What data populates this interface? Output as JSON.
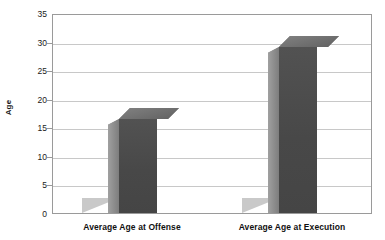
{
  "chart_data": {
    "type": "bar",
    "title": "",
    "subtitle": "",
    "xlabel": "",
    "ylabel": "Age",
    "categories": [
      "Average Age at Offense",
      "Average Age at Execution"
    ],
    "values": [
      16.5,
      29
    ],
    "series": [
      {
        "name": "Age",
        "values": [
          16.5,
          29
        ]
      }
    ],
    "ylim": [
      0,
      35
    ],
    "ytick_step": 5,
    "yticks": [
      "35",
      "30",
      "25",
      "20",
      "15",
      "10",
      "5",
      "0"
    ],
    "ytick_values": [
      35,
      30,
      25,
      20,
      15,
      10,
      5,
      0
    ],
    "grid": true,
    "grid_axis": "y",
    "legend": false,
    "legend_position": "none",
    "style": "3d-column",
    "colors": {
      "bar_front": "#4d4d4d",
      "bar_side": "#8d8d8d",
      "bar_top": "#6f6f6f",
      "gridline": "#c8c8c8",
      "frame": "#9a9a9a",
      "background": "#ffffff",
      "text": "#111111"
    }
  }
}
